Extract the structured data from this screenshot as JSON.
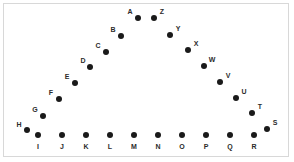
{
  "figure": {
    "title": "",
    "background_color": "#ffffff",
    "border_color": "#d8d8d8",
    "dot_color": "#1a1a1a",
    "label_color": "#2b2b2b",
    "width": 294,
    "height": 162
  },
  "chart_data": {
    "type": "scatter",
    "title": "",
    "xlabel": "",
    "ylabel": "",
    "grid": false,
    "legend": "none",
    "xlim": [
      0,
      294
    ],
    "ylim": [
      162,
      0
    ],
    "marker": "filled-circle",
    "marker_color": "#1a1a1a",
    "points": [
      {
        "label": "A",
        "x": 138,
        "y": 18,
        "label_x": 130,
        "label_y": 11,
        "group": "apex"
      },
      {
        "label": "B",
        "x": 121,
        "y": 36,
        "label_x": 113,
        "label_y": 29,
        "group": "left-diagonal"
      },
      {
        "label": "C",
        "x": 106,
        "y": 52,
        "label_x": 98,
        "label_y": 45,
        "group": "left-diagonal"
      },
      {
        "label": "D",
        "x": 90,
        "y": 67,
        "label_x": 83,
        "label_y": 60,
        "group": "left-diagonal"
      },
      {
        "label": "E",
        "x": 75,
        "y": 83,
        "label_x": 67,
        "label_y": 76,
        "group": "left-diagonal"
      },
      {
        "label": "F",
        "x": 59,
        "y": 99,
        "label_x": 51,
        "label_y": 92,
        "group": "left-diagonal"
      },
      {
        "label": "G",
        "x": 43,
        "y": 116,
        "label_x": 35,
        "label_y": 109,
        "group": "left-diagonal"
      },
      {
        "label": "H",
        "x": 27,
        "y": 130,
        "label_x": 19,
        "label_y": 124,
        "group": "left-diagonal"
      },
      {
        "label": "I",
        "x": 38,
        "y": 135,
        "label_x": 38,
        "label_y": 146,
        "group": "bottom-row"
      },
      {
        "label": "J",
        "x": 62,
        "y": 135,
        "label_x": 62,
        "label_y": 146,
        "group": "bottom-row"
      },
      {
        "label": "K",
        "x": 86,
        "y": 135,
        "label_x": 86,
        "label_y": 146,
        "group": "bottom-row"
      },
      {
        "label": "L",
        "x": 110,
        "y": 135,
        "label_x": 110,
        "label_y": 146,
        "group": "bottom-row"
      },
      {
        "label": "M",
        "x": 134,
        "y": 135,
        "label_x": 134,
        "label_y": 146,
        "group": "bottom-row"
      },
      {
        "label": "N",
        "x": 158,
        "y": 135,
        "label_x": 158,
        "label_y": 146,
        "group": "bottom-row"
      },
      {
        "label": "O",
        "x": 182,
        "y": 135,
        "label_x": 182,
        "label_y": 146,
        "group": "bottom-row"
      },
      {
        "label": "P",
        "x": 206,
        "y": 135,
        "label_x": 206,
        "label_y": 146,
        "group": "bottom-row"
      },
      {
        "label": "Q",
        "x": 230,
        "y": 135,
        "label_x": 230,
        "label_y": 146,
        "group": "bottom-row"
      },
      {
        "label": "R",
        "x": 254,
        "y": 135,
        "label_x": 254,
        "label_y": 146,
        "group": "bottom-row"
      },
      {
        "label": "S",
        "x": 267,
        "y": 129,
        "label_x": 275,
        "label_y": 122,
        "group": "right-diagonal"
      },
      {
        "label": "T",
        "x": 252,
        "y": 113,
        "label_x": 260,
        "label_y": 106,
        "group": "right-diagonal"
      },
      {
        "label": "U",
        "x": 236,
        "y": 98,
        "label_x": 244,
        "label_y": 91,
        "group": "right-diagonal"
      },
      {
        "label": "V",
        "x": 220,
        "y": 82,
        "label_x": 228,
        "label_y": 75,
        "group": "right-diagonal"
      },
      {
        "label": "W",
        "x": 204,
        "y": 66,
        "label_x": 212,
        "label_y": 59,
        "group": "right-diagonal"
      },
      {
        "label": "X",
        "x": 188,
        "y": 50,
        "label_x": 196,
        "label_y": 43,
        "group": "right-diagonal"
      },
      {
        "label": "Y",
        "x": 170,
        "y": 35,
        "label_x": 178,
        "label_y": 28,
        "group": "right-diagonal"
      },
      {
        "label": "Z",
        "x": 154,
        "y": 18,
        "label_x": 162,
        "label_y": 11,
        "group": "apex"
      }
    ]
  }
}
